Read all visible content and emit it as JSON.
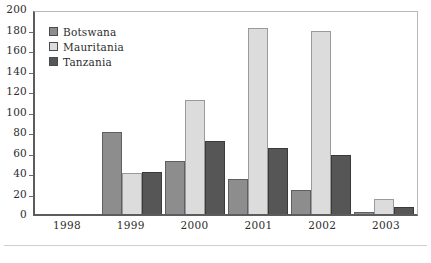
{
  "chart_data": {
    "type": "bar",
    "title": "",
    "subtitle": "",
    "xlabel": "",
    "ylabel": "",
    "categories": [
      "1998",
      "1999",
      "2000",
      "2001",
      "2002",
      "2003"
    ],
    "series": [
      {
        "name": "Botswana",
        "color": "#8d8d8d",
        "values": [
          0,
          80,
          52,
          34,
          23,
          2
        ]
      },
      {
        "name": "Mauritania",
        "color": "#dcdcdc",
        "values": [
          0,
          40,
          111,
          181,
          179,
          15
        ]
      },
      {
        "name": "Tanzania",
        "color": "#565656",
        "values": [
          0,
          41,
          71,
          64,
          58,
          7
        ]
      }
    ],
    "ylim": [
      0,
      200
    ],
    "ytick_step": 20,
    "yticks": [
      "200",
      "180",
      "160",
      "140",
      "120",
      "100",
      "80",
      "60",
      "40",
      "20",
      "0"
    ],
    "grid": false,
    "legend_position": "top-left"
  },
  "legend": {
    "items": [
      {
        "label": "Botswana",
        "swatch": "botswana"
      },
      {
        "label": "Mauritania",
        "swatch": "mauritania"
      },
      {
        "label": "Tanzania",
        "swatch": "tanzania"
      }
    ]
  }
}
